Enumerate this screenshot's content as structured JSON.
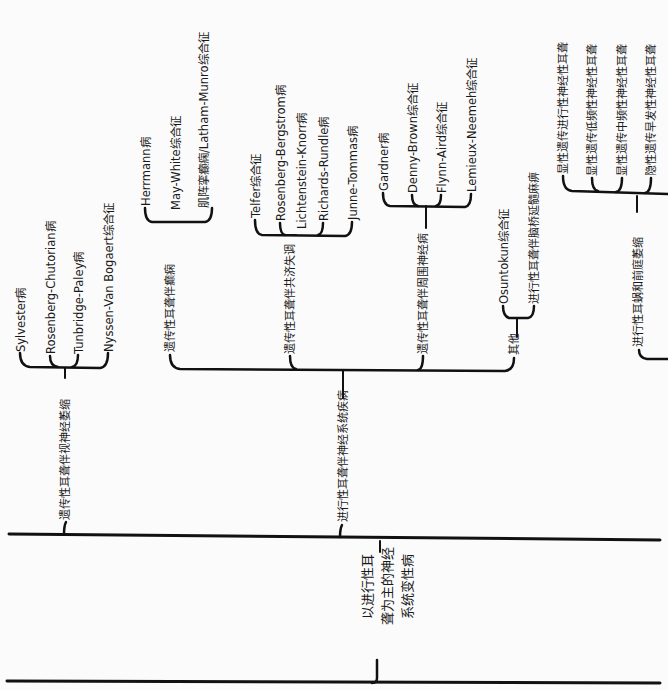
{
  "root": {
    "label_lines": [
      "以进行性耳",
      "聋为主的神经",
      "系统变性病"
    ]
  },
  "branches": [
    {
      "label": "遗传性耳聋伴视神经萎缩",
      "children": [
        "Sylvester病",
        "Rosenberg-Chutorian病",
        "Tunbridge-Paley病",
        "Nyssen-Van Bogaert综合征"
      ]
    },
    {
      "label": "进行性耳聋伴神经系统疾病",
      "children": [
        {
          "label": "遗传性耳聋伴癫痫",
          "children": [
            "Herrmann病",
            "May-White综合征",
            "肌阵挛癫痫/Latham-Munro综合征"
          ]
        },
        {
          "label": "遗传性耳聋伴共济失调",
          "children": [
            "Telfer综合征",
            "Rosenberg-Bergstrom病",
            "Lichtenstein-Knorr病",
            "Richards-Rundle病",
            "Junne-Tommas病"
          ]
        },
        {
          "label": "遗传性耳聋伴周围神经病",
          "children": [
            "Gardner病",
            "Denny-Brown综合征",
            "Flynn-Aird综合征",
            "Lemieux-Neemeh综合征"
          ]
        },
        {
          "label": "其他",
          "children": [
            "Osuntokun综合征",
            "进行性耳聋伴脑桥延髓麻痹"
          ]
        }
      ]
    },
    {
      "label": "进行性耳蜗和前庭萎缩",
      "children": [
        "显性遗传进行性神经性耳聋",
        "显性遗传低频性神经性耳聋",
        "显性遗传中频性神经性耳聋",
        "隐性遗传早发性神经性耳聋"
      ]
    }
  ],
  "colors": {
    "line": "#111111",
    "text": "#1a1a1a",
    "background": "#fbfbfb"
  }
}
